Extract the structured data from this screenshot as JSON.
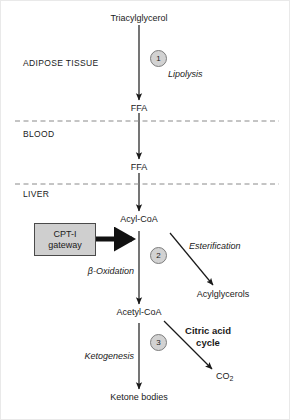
{
  "diagram": {
    "compartments": [
      {
        "id": "adipose",
        "label": "ADIPOSE TISSUE"
      },
      {
        "id": "blood",
        "label": "BLOOD"
      },
      {
        "id": "liver",
        "label": "LIVER"
      }
    ],
    "metabolites": [
      {
        "id": "tag",
        "label": "Triacylglycerol"
      },
      {
        "id": "ffa_adipose",
        "label": "FFA"
      },
      {
        "id": "ffa_blood",
        "label": "FFA"
      },
      {
        "id": "acyl_coa",
        "label": "Acyl-CoA"
      },
      {
        "id": "acetyl_coa",
        "label": "Acetyl-CoA"
      },
      {
        "id": "acylglycerols",
        "label": "Acylglycerols"
      },
      {
        "id": "ketone_bodies",
        "label": "Ketone bodies"
      },
      {
        "id": "co2",
        "label": "CO",
        "sub": "2"
      }
    ],
    "processes": [
      {
        "id": "lipolysis",
        "label": "Lipolysis",
        "style": "italic"
      },
      {
        "id": "esterification",
        "label": "Esterification",
        "style": "italic"
      },
      {
        "id": "beta_oxidation",
        "label": "β-Oxidation",
        "style": "italic"
      },
      {
        "id": "ketogenesis",
        "label": "Ketogenesis",
        "style": "italic"
      },
      {
        "id": "citric_acid_cycle",
        "label_line1": "Citric acid",
        "label_line2": "cycle",
        "style": "bold"
      }
    ],
    "steps": [
      {
        "id": "step-1",
        "label": "1"
      },
      {
        "id": "step-2",
        "label": "2"
      },
      {
        "id": "step-3",
        "label": "3"
      }
    ],
    "gateway": {
      "line1": "CPT-I",
      "line2": "gateway"
    },
    "colors": {
      "stroke": "#1a1a1a",
      "text": "#1a1a1a",
      "step_fill": "#d2d2d2",
      "step_border": "#7d7d7d",
      "gateway_fill": "#cfcfcf",
      "gateway_border": "#4a4a4a",
      "divider": "#8a8a8a",
      "background": "#ffffff"
    }
  }
}
